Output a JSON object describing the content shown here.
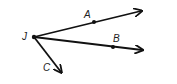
{
  "diagram": {
    "type": "geometry-rays",
    "stroke_color": "#111111",
    "vertex": {
      "label": "J",
      "x": 34,
      "y": 37,
      "label_x": 22,
      "label_y": 40
    },
    "rays": [
      {
        "name": "JA",
        "end_x": 141,
        "end_y": 11,
        "point": {
          "label": "A",
          "x": 94,
          "y": 22,
          "label_x": 84,
          "label_y": 18
        }
      },
      {
        "name": "JB",
        "end_x": 142,
        "end_y": 50,
        "point": {
          "label": "B",
          "x": 113,
          "y": 47,
          "label_x": 113,
          "label_y": 42
        }
      },
      {
        "name": "JC",
        "end_x": 61,
        "end_y": 72,
        "point": {
          "label": "C",
          "label_x": 43,
          "label_y": 71
        }
      }
    ]
  }
}
